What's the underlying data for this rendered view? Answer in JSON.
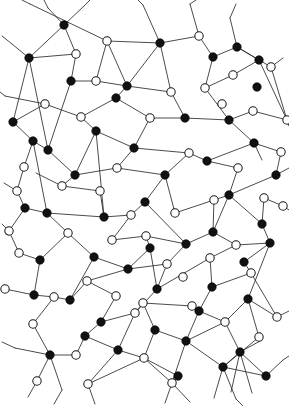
{
  "figure": {
    "kind": "node-link diagram",
    "background_color": "#ffffff",
    "edge_color": "#2b2b2b",
    "filled_node_color": "#111111",
    "open_node_fill": "#ffffff",
    "open_node_stroke": "#1a1a1a",
    "node_radius": 4.2,
    "edge_width": 0.85,
    "width": 289,
    "height": 406,
    "filled_node_count": 52,
    "open_node_count": 53
  },
  "chart_data": {
    "type": "scatter",
    "xlabel": "",
    "ylabel": "",
    "xlim": [
      0,
      289
    ],
    "ylim": [
      0,
      406
    ],
    "grid": false,
    "legend": [
      {
        "name": "filled node",
        "marker": "filled-circle",
        "color": "#111111"
      },
      {
        "name": "open node",
        "marker": "open-circle",
        "color": "#ffffff"
      }
    ],
    "series": [
      {
        "name": "filled node",
        "marker": "filled-circle",
        "points": [
          [
            64,
            25
          ],
          [
            29,
            58
          ],
          [
            71,
            81
          ],
          [
            127,
            86
          ],
          [
            160,
            43
          ],
          [
            237,
            47
          ],
          [
            213,
            57
          ],
          [
            257,
            87
          ],
          [
            254,
            143
          ],
          [
            185,
            118
          ],
          [
            116,
            98
          ],
          [
            33,
            141
          ],
          [
            75,
            175
          ],
          [
            134,
            148
          ],
          [
            165,
            175
          ],
          [
            207,
            161
          ],
          [
            276,
            175
          ],
          [
            229,
            195
          ],
          [
            25,
            208
          ],
          [
            47,
            213
          ],
          [
            104,
            217
          ],
          [
            145,
            202
          ],
          [
            186,
            244
          ],
          [
            213,
            232
          ],
          [
            262,
            224
          ],
          [
            40,
            260
          ],
          [
            94,
            257
          ],
          [
            150,
            248
          ],
          [
            244,
            262
          ],
          [
            34,
            295
          ],
          [
            101,
            322
          ],
          [
            157,
            289
          ],
          [
            199,
            311
          ],
          [
            248,
            299
          ],
          [
            118,
            350
          ],
          [
            50,
            355
          ],
          [
            186,
            341
          ],
          [
            240,
            352
          ],
          [
            266,
            376
          ],
          [
            178,
            376
          ],
          [
            85,
            336
          ],
          [
            229,
            120
          ],
          [
            96,
            131
          ],
          [
            259,
            60
          ],
          [
            13,
            122
          ],
          [
            270,
            243
          ],
          [
            155,
            330
          ],
          [
            212,
            287
          ],
          [
            70,
            300
          ],
          [
            128,
            269
          ],
          [
            223,
            367
          ],
          [
            48,
            150
          ]
        ]
      },
      {
        "name": "open node",
        "marker": "open-circle",
        "points": [
          [
            76,
            54
          ],
          [
            107,
            41
          ],
          [
            199,
            36
          ],
          [
            233,
            75
          ],
          [
            271,
            67
          ],
          [
            96,
            81
          ],
          [
            171,
            92
          ],
          [
            222,
            104
          ],
          [
            287,
            120
          ],
          [
            45,
            104
          ],
          [
            81,
            117
          ],
          [
            150,
            118
          ],
          [
            189,
            153
          ],
          [
            253,
            111
          ],
          [
            24,
            167
          ],
          [
            117,
            168
          ],
          [
            17,
            191
          ],
          [
            62,
            186
          ],
          [
            100,
            191
          ],
          [
            238,
            168
          ],
          [
            281,
            152
          ],
          [
            9,
            231
          ],
          [
            68,
            233
          ],
          [
            131,
            215
          ],
          [
            175,
            213
          ],
          [
            214,
            200
          ],
          [
            264,
            198
          ],
          [
            283,
            206
          ],
          [
            19,
            253
          ],
          [
            87,
            281
          ],
          [
            146,
            236
          ],
          [
            183,
            277
          ],
          [
            236,
            245
          ],
          [
            5,
            289
          ],
          [
            54,
            297
          ],
          [
            116,
            296
          ],
          [
            167,
            264
          ],
          [
            210,
            258
          ],
          [
            251,
            273
          ],
          [
            277,
            317
          ],
          [
            33,
            324
          ],
          [
            76,
            355
          ],
          [
            135,
            313
          ],
          [
            192,
            306
          ],
          [
            225,
            322
          ],
          [
            144,
            358
          ],
          [
            88,
            384
          ],
          [
            172,
            383
          ],
          [
            259,
            337
          ],
          [
            37,
            381
          ],
          [
            112,
            240
          ],
          [
            205,
            88
          ],
          [
            143,
            303
          ]
        ]
      }
    ],
    "edges": [
      [
        64,
        25,
        29,
        58
      ],
      [
        64,
        25,
        76,
        54
      ],
      [
        64,
        25,
        48,
        8
      ],
      [
        64,
        25,
        84,
        6
      ],
      [
        76,
        54,
        29,
        58
      ],
      [
        76,
        54,
        71,
        81
      ],
      [
        29,
        58,
        12,
        44
      ],
      [
        29,
        58,
        13,
        122
      ],
      [
        29,
        58,
        48,
        150
      ],
      [
        107,
        41,
        30,
        4
      ],
      [
        107,
        41,
        96,
        81
      ],
      [
        107,
        41,
        160,
        43
      ],
      [
        107,
        41,
        127,
        86
      ],
      [
        71,
        81,
        48,
        150
      ],
      [
        71,
        81,
        96,
        81
      ],
      [
        96,
        81,
        127,
        86
      ],
      [
        127,
        86,
        160,
        43
      ],
      [
        160,
        43,
        199,
        36
      ],
      [
        160,
        43,
        143,
        5
      ],
      [
        160,
        43,
        171,
        92
      ],
      [
        199,
        36,
        213,
        57
      ],
      [
        199,
        36,
        190,
        4
      ],
      [
        213,
        57,
        237,
        47
      ],
      [
        213,
        57,
        205,
        88
      ],
      [
        237,
        47,
        259,
        60
      ],
      [
        237,
        47,
        230,
        18
      ],
      [
        237,
        47,
        271,
        67
      ],
      [
        259,
        60,
        233,
        75
      ],
      [
        259,
        60,
        287,
        120
      ],
      [
        271,
        67,
        287,
        120
      ],
      [
        233,
        75,
        205,
        88
      ],
      [
        205,
        88,
        229,
        120
      ],
      [
        171,
        92,
        127,
        86
      ],
      [
        171,
        92,
        185,
        118
      ],
      [
        127,
        86,
        116,
        98
      ],
      [
        116,
        98,
        81,
        117
      ],
      [
        116,
        98,
        150,
        118
      ],
      [
        150,
        118,
        185,
        118
      ],
      [
        185,
        118,
        229,
        120
      ],
      [
        229,
        120,
        253,
        111
      ],
      [
        229,
        120,
        254,
        143
      ],
      [
        253,
        111,
        287,
        120
      ],
      [
        81,
        117,
        45,
        104
      ],
      [
        45,
        104,
        13,
        122
      ],
      [
        45,
        104,
        5,
        96
      ],
      [
        13,
        122,
        33,
        141
      ],
      [
        33,
        141,
        48,
        150
      ],
      [
        48,
        150,
        75,
        175
      ],
      [
        33,
        141,
        24,
        167
      ],
      [
        24,
        167,
        17,
        191
      ],
      [
        96,
        131,
        81,
        117
      ],
      [
        96,
        131,
        134,
        148
      ],
      [
        96,
        131,
        75,
        175
      ],
      [
        134,
        148,
        150,
        118
      ],
      [
        134,
        148,
        189,
        153
      ],
      [
        134,
        148,
        117,
        168
      ],
      [
        189,
        153,
        207,
        161
      ],
      [
        189,
        153,
        165,
        175
      ],
      [
        207,
        161,
        254,
        143
      ],
      [
        207,
        161,
        238,
        168
      ],
      [
        254,
        143,
        281,
        152
      ],
      [
        238,
        168,
        229,
        195
      ],
      [
        281,
        152,
        276,
        175
      ],
      [
        276,
        175,
        229,
        195
      ],
      [
        75,
        175,
        117,
        168
      ],
      [
        117,
        168,
        165,
        175
      ],
      [
        165,
        175,
        145,
        202
      ],
      [
        165,
        175,
        175,
        213
      ],
      [
        75,
        175,
        62,
        186
      ],
      [
        62,
        186,
        100,
        191
      ],
      [
        100,
        191,
        104,
        217
      ],
      [
        17,
        191,
        25,
        208
      ],
      [
        25,
        208,
        47,
        213
      ],
      [
        47,
        213,
        104,
        217
      ],
      [
        25,
        208,
        9,
        231
      ],
      [
        9,
        231,
        19,
        253
      ],
      [
        104,
        217,
        131,
        215
      ],
      [
        131,
        215,
        145,
        202
      ],
      [
        145,
        202,
        186,
        244
      ],
      [
        131,
        215,
        112,
        240
      ],
      [
        112,
        240,
        146,
        236
      ],
      [
        146,
        236,
        186,
        244
      ],
      [
        175,
        213,
        214,
        200
      ],
      [
        214,
        200,
        229,
        195
      ],
      [
        214,
        200,
        213,
        232
      ],
      [
        229,
        195,
        262,
        224
      ],
      [
        262,
        224,
        264,
        198
      ],
      [
        264,
        198,
        283,
        206
      ],
      [
        262,
        224,
        270,
        243
      ],
      [
        270,
        243,
        236,
        245
      ],
      [
        236,
        245,
        213,
        232
      ],
      [
        213,
        232,
        186,
        244
      ],
      [
        186,
        244,
        167,
        264
      ],
      [
        167,
        264,
        128,
        269
      ],
      [
        128,
        269,
        94,
        257
      ],
      [
        94,
        257,
        68,
        233
      ],
      [
        68,
        233,
        47,
        213
      ],
      [
        68,
        233,
        40,
        260
      ],
      [
        40,
        260,
        19,
        253
      ],
      [
        40,
        260,
        34,
        295
      ],
      [
        34,
        295,
        5,
        289
      ],
      [
        34,
        295,
        54,
        297
      ],
      [
        54,
        297,
        70,
        300
      ],
      [
        70,
        300,
        94,
        257
      ],
      [
        70,
        300,
        87,
        281
      ],
      [
        87,
        281,
        128,
        269
      ],
      [
        128,
        269,
        150,
        248
      ],
      [
        150,
        248,
        146,
        236
      ],
      [
        150,
        248,
        157,
        289
      ],
      [
        157,
        289,
        135,
        313
      ],
      [
        157,
        289,
        210,
        258
      ],
      [
        210,
        258,
        236,
        245
      ],
      [
        210,
        258,
        212,
        287
      ],
      [
        212,
        287,
        199,
        311
      ],
      [
        212,
        287,
        251,
        273
      ],
      [
        251,
        273,
        244,
        262
      ],
      [
        244,
        262,
        270,
        243
      ],
      [
        251,
        273,
        277,
        317
      ],
      [
        277,
        317,
        248,
        299
      ],
      [
        248,
        299,
        225,
        322
      ],
      [
        225,
        322,
        199,
        311
      ],
      [
        199,
        311,
        192,
        306
      ],
      [
        192,
        306,
        143,
        303
      ],
      [
        143,
        303,
        135,
        313
      ],
      [
        135,
        313,
        101,
        322
      ],
      [
        101,
        322,
        116,
        296
      ],
      [
        116,
        296,
        87,
        281
      ],
      [
        101,
        322,
        85,
        336
      ],
      [
        85,
        336,
        76,
        355
      ],
      [
        76,
        355,
        50,
        355
      ],
      [
        50,
        355,
        33,
        324
      ],
      [
        33,
        324,
        54,
        297
      ],
      [
        50,
        355,
        37,
        381
      ],
      [
        50,
        355,
        62,
        390
      ],
      [
        50,
        355,
        15,
        348
      ],
      [
        118,
        350,
        144,
        358
      ],
      [
        144,
        358,
        155,
        330
      ],
      [
        155,
        330,
        143,
        303
      ],
      [
        155,
        330,
        186,
        341
      ],
      [
        186,
        341,
        225,
        322
      ],
      [
        186,
        341,
        172,
        383
      ],
      [
        172,
        383,
        144,
        358
      ],
      [
        144,
        358,
        88,
        384
      ],
      [
        88,
        384,
        118,
        350
      ],
      [
        118,
        350,
        85,
        336
      ],
      [
        186,
        341,
        223,
        367
      ],
      [
        223,
        367,
        259,
        337
      ],
      [
        259,
        337,
        248,
        299
      ],
      [
        223,
        367,
        266,
        376
      ],
      [
        266,
        376,
        283,
        360
      ],
      [
        223,
        367,
        214,
        398
      ],
      [
        223,
        367,
        236,
        399
      ],
      [
        172,
        383,
        165,
        403
      ],
      [
        88,
        384,
        95,
        404
      ],
      [
        172,
        383,
        190,
        402
      ],
      [
        17,
        191,
        4,
        183
      ],
      [
        62,
        186,
        36,
        173
      ],
      [
        9,
        231,
        2,
        224
      ],
      [
        283,
        206,
        289,
        210
      ],
      [
        276,
        175,
        289,
        168
      ],
      [
        287,
        120,
        289,
        126
      ],
      [
        12,
        44,
        2,
        36
      ],
      [
        5,
        96,
        0,
        92
      ],
      [
        30,
        4,
        22,
        0
      ],
      [
        48,
        8,
        44,
        0
      ],
      [
        84,
        6,
        90,
        0
      ],
      [
        143,
        5,
        138,
        0
      ],
      [
        190,
        4,
        196,
        0
      ],
      [
        230,
        18,
        236,
        4
      ],
      [
        271,
        67,
        283,
        58
      ],
      [
        254,
        143,
        262,
        160
      ],
      [
        104,
        217,
        96,
        131
      ],
      [
        47,
        213,
        33,
        141
      ],
      [
        157,
        289,
        167,
        264
      ],
      [
        248,
        299,
        270,
        243
      ],
      [
        199,
        311,
        186,
        341
      ],
      [
        135,
        313,
        118,
        350
      ],
      [
        240,
        352,
        266,
        376
      ],
      [
        240,
        352,
        225,
        322
      ],
      [
        240,
        352,
        223,
        367
      ],
      [
        240,
        352,
        262,
        340
      ],
      [
        240,
        352,
        231,
        392
      ],
      [
        240,
        352,
        252,
        393
      ],
      [
        178,
        376,
        172,
        383
      ],
      [
        178,
        376,
        144,
        358
      ],
      [
        213,
        232,
        229,
        195
      ],
      [
        62,
        390,
        54,
        404
      ],
      [
        37,
        381,
        28,
        397
      ],
      [
        15,
        348,
        2,
        342
      ],
      [
        283,
        360,
        289,
        356
      ],
      [
        277,
        317,
        289,
        311
      ],
      [
        236,
        399,
        243,
        406
      ]
    ]
  }
}
